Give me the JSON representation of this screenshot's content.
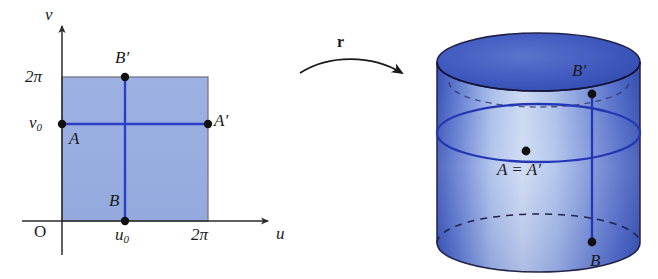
{
  "figure": {
    "kind": "parametrization-diagram"
  },
  "colors": {
    "square_fill": "#9aafe1",
    "square_edge": "#6a6a78",
    "curve_blue": "#2a3fc4",
    "cylinder_dark": "#3a55bb",
    "cylinder_light": "#c9d6f2",
    "cylinder_top": "#3b55bb",
    "outline": "#22224a",
    "axis": "#2b2b2b",
    "dot": "#111111"
  },
  "domain_plot": {
    "axes": {
      "v_axis_label": "v",
      "u_axis_label": "u",
      "origin_label": "O"
    },
    "ticks": {
      "v_top": "2π",
      "v_mid": "v",
      "v_mid_sub": "0",
      "u_mid": "u",
      "u_mid_sub": "0",
      "u_right": "2π"
    },
    "points": [
      {
        "label": "B",
        "prime": "′",
        "name": "B-prime"
      },
      {
        "label": "A",
        "prime": "",
        "name": "A"
      },
      {
        "label": "A",
        "prime": "′",
        "name": "A-prime"
      },
      {
        "label": "B",
        "prime": "",
        "name": "B"
      }
    ]
  },
  "map_arrow": {
    "label": "r"
  },
  "cylinder": {
    "points": [
      {
        "label": "B",
        "prime": "′",
        "name": "B-prime"
      },
      {
        "label": "A = A",
        "prime": "′",
        "name": "A-equals-A-prime"
      },
      {
        "label": "B",
        "prime": "",
        "name": "B"
      }
    ]
  }
}
